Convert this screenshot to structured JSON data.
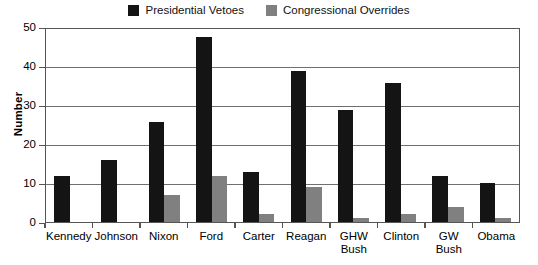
{
  "chart_data": {
    "type": "bar",
    "title": "",
    "subtitle": "",
    "xlabel": "",
    "ylabel": "Number",
    "ylim": [
      0,
      50
    ],
    "yticks": [
      0,
      10,
      20,
      30,
      40,
      50
    ],
    "ytick_labels": [
      "0",
      "10",
      "20",
      "30",
      "40",
      "50"
    ],
    "grid": true,
    "legend_position": "top-center",
    "categories": [
      "Kennedy",
      "Johnson",
      "Nixon",
      "Ford",
      "Carter",
      "Reagan",
      "GHW Bush",
      "Clinton",
      "GW Bush",
      "Obama"
    ],
    "series": [
      {
        "name": "Presidential Vetoes",
        "color": "#141414",
        "values": [
          12,
          16,
          26,
          48,
          13,
          39,
          29,
          36,
          12,
          10
        ]
      },
      {
        "name": "Congressional Overrides",
        "color": "#808080",
        "values": [
          0,
          0,
          7,
          12,
          2,
          9,
          1,
          2,
          4,
          1
        ]
      }
    ]
  },
  "legend": {
    "entries": [
      {
        "label": "Presidential Vetoes",
        "swatch": "#141414"
      },
      {
        "label": "Congressional Overrides",
        "swatch": "#808080"
      }
    ]
  },
  "axes": {
    "y_title": "Number",
    "y_tick_labels": [
      "50",
      "40",
      "30",
      "20",
      "10",
      "0"
    ],
    "x_tick_labels": [
      "Kennedy",
      "Johnson",
      "Nixon",
      "Ford",
      "Carter",
      "Reagan",
      "GHW Bush",
      "Clinton",
      "GW Bush",
      "Obama"
    ]
  },
  "colors": {
    "vetoes": "#141414",
    "overrides": "#808080",
    "gridline": "#6f6f6f",
    "axis": "#555555",
    "background": "#ffffff",
    "text": "#000000"
  }
}
